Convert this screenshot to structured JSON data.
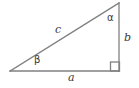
{
  "figure": {
    "kind": "right-triangle-diagram",
    "background_color": "#ffffff",
    "stroke_color": "#808080",
    "label_color": "#3a3a3a",
    "width": 139,
    "height": 88
  },
  "geometry": {
    "vertices": {
      "left": {
        "x": 10,
        "y": 71
      },
      "apex": {
        "x": 119,
        "y": 3
      },
      "right_angle": {
        "x": 119,
        "y": 71
      }
    },
    "right_angle_marker": {
      "x": 111,
      "y": 62,
      "size": 9
    }
  },
  "labels": {
    "hypotenuse": "c",
    "base": "a",
    "vertical": "b",
    "angle_top": "α",
    "angle_left": "β"
  }
}
